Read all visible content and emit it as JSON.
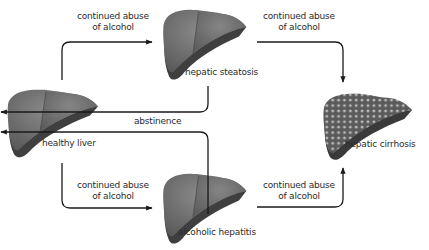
{
  "diagram": {
    "title": "",
    "colors": {
      "liver_light": "#7a7a7a",
      "liver_mid": "#5e5e5e",
      "liver_dark": "#3f3f3f",
      "arrow": "#1a1a1a",
      "text": "#2b2b2b",
      "nodule": "#d6d6d6"
    },
    "nodes": [
      {
        "id": "healthy",
        "label": "healthy liver"
      },
      {
        "id": "steatosis",
        "label": "hepatic steatosis"
      },
      {
        "id": "hepatitis",
        "label": "alcoholic hepatitis"
      },
      {
        "id": "cirrhosis",
        "label": "hepatic cirrhosis"
      }
    ],
    "edges": [
      {
        "from": "healthy",
        "to": "steatosis",
        "label_line1": "continued abuse",
        "label_line2": "of alcohol"
      },
      {
        "from": "steatosis",
        "to": "cirrhosis",
        "label_line1": "continued abuse",
        "label_line2": "of alcohol"
      },
      {
        "from": "healthy",
        "to": "hepatitis",
        "label_line1": "continued abuse",
        "label_line2": "of alcohol"
      },
      {
        "from": "hepatitis",
        "to": "cirrhosis",
        "label_line1": "continued abuse",
        "label_line2": "of alcohol"
      },
      {
        "from": "steatosis",
        "to": "healthy",
        "label": "abstinence"
      },
      {
        "from": "hepatitis",
        "to": "healthy",
        "label": "abstinence"
      }
    ]
  }
}
